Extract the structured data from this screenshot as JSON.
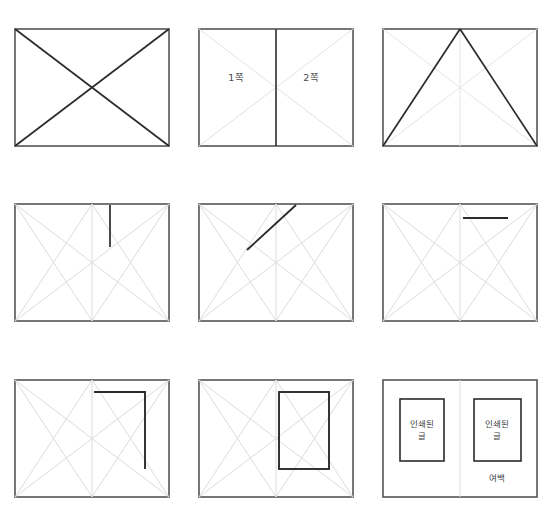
{
  "page": {
    "background_color": "#ffffff",
    "dark_line_color": "#2b2b2b",
    "light_line_color": "#d8d8d8",
    "frame_color": "#555555",
    "text_color": "#4a4a4a"
  },
  "figures": [
    {
      "id": "fig-1",
      "position": "row1-col1",
      "caption": "",
      "labels": []
    },
    {
      "id": "fig-2",
      "position": "row1-col2",
      "caption": "",
      "labels": [
        {
          "text": "1쪽",
          "x": 38,
          "y": 50
        },
        {
          "text": "2쪽",
          "x": 113,
          "y": 50
        }
      ]
    },
    {
      "id": "fig-3",
      "position": "row1-col3",
      "caption": "",
      "labels": []
    },
    {
      "id": "fig-4",
      "position": "row2-col1",
      "caption": "",
      "labels": []
    },
    {
      "id": "fig-5",
      "position": "row2-col2",
      "caption": "",
      "labels": []
    },
    {
      "id": "fig-6",
      "position": "row2-col3",
      "caption": "",
      "labels": []
    },
    {
      "id": "fig-7",
      "position": "row3-col1",
      "caption": "",
      "labels": []
    },
    {
      "id": "fig-8",
      "position": "row3-col2",
      "caption": "",
      "labels": []
    },
    {
      "id": "fig-9",
      "position": "row3-col3",
      "caption": "",
      "labels": [
        {
          "text": "인쇄된\n글",
          "x": 38,
          "y": 51
        },
        {
          "text": "인쇄된\n글",
          "x": 113,
          "y": 51
        },
        {
          "text": "여백",
          "x": 113,
          "y": 100
        }
      ]
    }
  ],
  "text": {
    "page_one": "1쪽",
    "page_two": "2쪽",
    "printed_text": "인쇄된\n글",
    "margin": "여백"
  }
}
